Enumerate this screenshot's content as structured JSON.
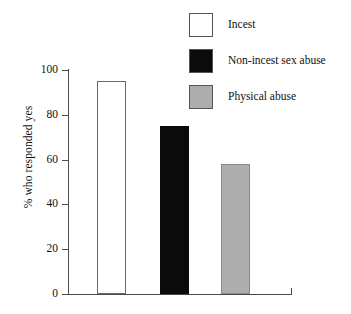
{
  "chart_data": {
    "type": "bar",
    "title": "",
    "subtitle": "",
    "xlabel": "",
    "ylabel": "% who responded yes",
    "ylim": [
      0,
      100
    ],
    "yticks": [
      0,
      20,
      40,
      60,
      80,
      100
    ],
    "ytick_labels": [
      "0",
      "20",
      "40",
      "60",
      "80",
      "100"
    ],
    "grid": false,
    "legend_position": "top-right",
    "categories": [
      "Incest",
      "Non-incest sex abuse",
      "Physical abuse"
    ],
    "values": [
      95,
      75,
      58
    ],
    "series": [
      {
        "name": "% who responded yes",
        "values": [
          95,
          75,
          58
        ]
      }
    ],
    "bars": [
      {
        "label": "Incest",
        "value": 95,
        "fill": "#ffffff",
        "stroke": "#6a6a6a"
      },
      {
        "label": "Non-incest sex abuse",
        "value": 75,
        "fill": "#0b0b0b",
        "stroke": "#0b0b0b"
      },
      {
        "label": "Physical abuse",
        "value": 58,
        "fill": "#adadad",
        "stroke": "#8a8a8a"
      }
    ],
    "legend": [
      {
        "label": "Incest",
        "swatch": "#ffffff"
      },
      {
        "label": "Non-incest sex abuse",
        "swatch": "#0b0b0b"
      },
      {
        "label": "Physical abuse",
        "swatch": "#adadad"
      }
    ]
  }
}
